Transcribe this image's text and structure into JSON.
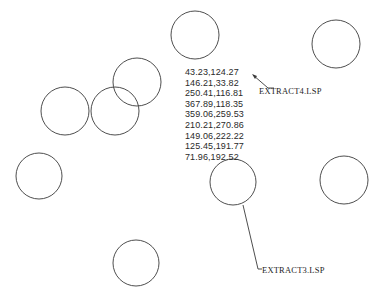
{
  "drawing": {
    "stroke_color": "#3a3a3a",
    "background": "#ffffff",
    "circles": [
      {
        "name": "circle-top",
        "cx": 195,
        "cy": 35,
        "r": 24
      },
      {
        "name": "circle-top-right",
        "cx": 336,
        "cy": 44,
        "r": 24
      },
      {
        "name": "circle-upper-mid",
        "cx": 137,
        "cy": 82,
        "r": 24
      },
      {
        "name": "circle-left",
        "cx": 65,
        "cy": 111,
        "r": 24
      },
      {
        "name": "circle-mid",
        "cx": 115,
        "cy": 111,
        "r": 24
      },
      {
        "name": "circle-lower-left",
        "cx": 39,
        "cy": 176,
        "r": 23
      },
      {
        "name": "circle-center-right",
        "cx": 233,
        "cy": 182,
        "r": 23
      },
      {
        "name": "circle-far-right",
        "cx": 344,
        "cy": 180,
        "r": 24
      },
      {
        "name": "circle-bottom",
        "cx": 136,
        "cy": 263,
        "r": 23
      }
    ]
  },
  "coordinates_list": [
    "43.23,124.27",
    "146.21,33.82",
    "250.41,116.81",
    "367.89,118.35",
    "359.06,259.53",
    "210.21,270.86",
    "149.06,222.22",
    "125.45,191.77",
    "71.96,192.52"
  ],
  "annotations": {
    "extract4": {
      "text": "EXTRACT4.LSP"
    },
    "extract3": {
      "text": "EXTRACT3.LSP"
    }
  }
}
